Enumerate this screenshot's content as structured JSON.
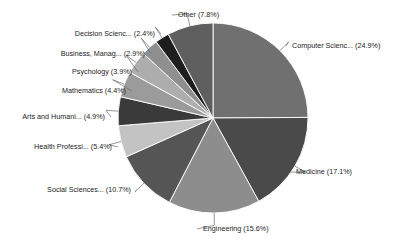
{
  "chart_data": {
    "type": "pie",
    "title": "",
    "subtitle": "",
    "xlabel": "",
    "ylabel": "",
    "legend_position": "none",
    "grid": false,
    "start_angle_deg": 0,
    "direction": "clockwise",
    "labels": [
      "Computer Scienc...",
      "Medicine",
      "Engineering",
      "Social Sciences...",
      "Health Professi...",
      "Arts and Humani...",
      "Mathematics",
      "Psychology",
      "Business, Manag...",
      "Decision Scienc...",
      "Other"
    ],
    "values": [
      24.9,
      17.1,
      15.6,
      10.7,
      5.4,
      4.9,
      4.4,
      3.9,
      2.9,
      2.4,
      7.8
    ],
    "value_unit": "%",
    "colors": [
      "#707070",
      "#4a4a4a",
      "#8d8d8d",
      "#555555",
      "#c3c3c3",
      "#3a3a3a",
      "#9b9b9b",
      "#adadad",
      "#8f8f8f",
      "#1e1e1e",
      "#5f5f5f"
    ],
    "slices": [
      {
        "label": "Computer Scienc...",
        "value": 24.9,
        "display": "Computer Scienc... (24.9%)",
        "color": "#707070"
      },
      {
        "label": "Medicine",
        "value": 17.1,
        "display": "Medicine (17.1%)",
        "color": "#4a4a4a"
      },
      {
        "label": "Engineering",
        "value": 15.6,
        "display": "Engineering (15.6%)",
        "color": "#8d8d8d"
      },
      {
        "label": "Social Sciences...",
        "value": 10.7,
        "display": "Social Sciences... (10.7%)",
        "color": "#555555"
      },
      {
        "label": "Health Professi...",
        "value": 5.4,
        "display": "Health Professi... (5.4%)",
        "color": "#c3c3c3"
      },
      {
        "label": "Arts and Humani...",
        "value": 4.9,
        "display": "Arts and Humani... (4.9%)",
        "color": "#3a3a3a"
      },
      {
        "label": "Mathematics",
        "value": 4.4,
        "display": "Mathematics (4.4%)",
        "color": "#9b9b9b"
      },
      {
        "label": "Psychology",
        "value": 3.9,
        "display": "Psychology (3.9%)",
        "color": "#adadad"
      },
      {
        "label": "Business, Manag...",
        "value": 2.9,
        "display": "Business, Manag... (2.9%)",
        "color": "#8f8f8f"
      },
      {
        "label": "Decision Scienc...",
        "value": 2.4,
        "display": "Decision Scienc... (2.4%)",
        "color": "#1e1e1e"
      },
      {
        "label": "Other",
        "value": 7.8,
        "display": "Other (7.8%)",
        "color": "#5f5f5f"
      }
    ]
  },
  "geometry": {
    "cx": 213,
    "cy": 118,
    "r": 95
  },
  "label_layout": [
    {
      "x": 292,
      "y": 46,
      "anchor": "start",
      "elbow_x": 286,
      "name": "pie-label-computer-science"
    },
    {
      "x": 296,
      "y": 172,
      "anchor": "start",
      "elbow_x": 290,
      "name": "pie-label-medicine"
    },
    {
      "x": 203,
      "y": 229,
      "anchor": "start",
      "elbow_x": 197,
      "name": "pie-label-engineering"
    },
    {
      "x": 131,
      "y": 190,
      "anchor": "end",
      "elbow_x": 137,
      "name": "pie-label-social-sciences"
    },
    {
      "x": 112,
      "y": 147,
      "anchor": "end",
      "elbow_x": 118,
      "name": "pie-label-health-professions"
    },
    {
      "x": 105,
      "y": 117,
      "anchor": "end",
      "elbow_x": 111,
      "name": "pie-label-arts-and-humanities"
    },
    {
      "x": 126,
      "y": 91,
      "anchor": "end",
      "elbow_x": 132,
      "name": "pie-label-mathematics"
    },
    {
      "x": 132,
      "y": 72,
      "anchor": "end",
      "elbow_x": 138,
      "name": "pie-label-psychology"
    },
    {
      "x": 145,
      "y": 54,
      "anchor": "end",
      "elbow_x": 151,
      "name": "pie-label-business-management"
    },
    {
      "x": 155,
      "y": 34,
      "anchor": "end",
      "elbow_x": 161,
      "name": "pie-label-decision-sciences"
    },
    {
      "x": 178,
      "y": 15,
      "anchor": "start",
      "elbow_x": 172,
      "name": "pie-label-other"
    }
  ]
}
